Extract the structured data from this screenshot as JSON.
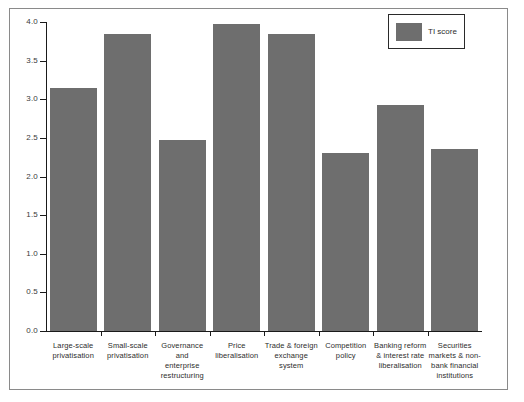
{
  "chart_data": {
    "type": "bar",
    "title": "",
    "subtitle": "",
    "xlabel": "",
    "ylabel": "",
    "ylim": [
      0.0,
      4.0
    ],
    "grid": false,
    "legend_position": "top-right",
    "categories": [
      "Large-scale privatisation",
      "Small-scale privatisation",
      "Governance and enterprise restructuring",
      "Price liberalisation",
      "Trade & foreign exchange system",
      "Competition policy",
      "Banking reform & interest rate liberalisation",
      "Securities markets & non-bank financial institutions"
    ],
    "category_lines": [
      [
        "Large-scale",
        "privatisation"
      ],
      [
        "Small-scale",
        "privatisation"
      ],
      [
        "Governance and",
        "enterprise",
        "restructuring"
      ],
      [
        "Price",
        "liberalisation"
      ],
      [
        "Trade & foreign",
        "exchange system"
      ],
      [
        "Competition",
        "policy"
      ],
      [
        "Banking reform",
        "& interest rate",
        "liberalisation"
      ],
      [
        "Securities",
        "markets & non-",
        "bank financial",
        "institutions"
      ]
    ],
    "series": [
      {
        "name": "TI score",
        "color": "#6e6e6e",
        "values": [
          3.15,
          3.85,
          2.47,
          3.97,
          3.85,
          2.3,
          2.92,
          2.35
        ]
      }
    ],
    "y_ticks": [
      {
        "value": 4.0,
        "label": "4.0"
      },
      {
        "value": 3.5,
        "label": "3.5"
      },
      {
        "value": 3.0,
        "label": "3.0"
      },
      {
        "value": 2.5,
        "label": "2.5"
      },
      {
        "value": 2.0,
        "label": "2.0"
      },
      {
        "value": 1.5,
        "label": "1.5"
      },
      {
        "value": 1.0,
        "label": "1.0"
      },
      {
        "value": 0.5,
        "label": "0.5"
      },
      {
        "value": 0.0,
        "label": "0.0"
      }
    ]
  },
  "legend": {
    "entries": [
      {
        "label": "TI score",
        "color": "#6e6e6e"
      }
    ]
  },
  "colors": {
    "bar": "#6e6e6e",
    "axis": "#1a1a1a",
    "frame": "#8a8a8a",
    "text": "#2d2d2d",
    "background": "#ffffff"
  }
}
